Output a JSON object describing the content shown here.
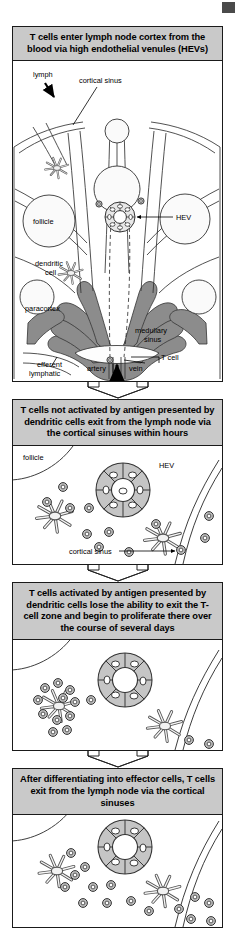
{
  "figure": {
    "title_sequence": "T cell trafficking through the lymph node",
    "panels": [
      {
        "id": "panel-1",
        "title": "T cells enter lymph node cortex from the blood via high endothelial venules (HEVs)",
        "labels": {
          "lymph": "lymph",
          "cortical_sinus": "cortical sinus",
          "follicle": "follicle",
          "dendritic_cell": "dendritic\ncell",
          "dendritic_cell_line1": "dendritic",
          "dendritic_cell_line2": "cell",
          "hev": "HEV",
          "paracortex": "paracortex",
          "medullary_sinus_line1": "medullary",
          "medullary_sinus_line2": "sinus",
          "efferent_lymphatic_line1": "efferent",
          "efferent_lymphatic_line2": "lymphatic",
          "artery": "artery",
          "vein": "vein",
          "t_cell": "T cell"
        }
      },
      {
        "id": "panel-2",
        "title": "T cells not activated by antigen presented by dendritic cells exit from the lymph node via the cortical sinuses within hours",
        "labels": {
          "follicle": "follicle",
          "hev": "HEV",
          "cortical_sinus": "cortical sinus"
        }
      },
      {
        "id": "panel-3",
        "title": "T cells activated by antigen presented by dendritic cells lose the ability to exit the T-cell zone and begin to proliferate there over the course of several days",
        "labels": {}
      },
      {
        "id": "panel-4",
        "title": "After differentiating into effector cells, T cells exit from the lymph node via the cortical sinuses",
        "labels": {}
      }
    ],
    "colors": {
      "title_background": "#c9c9c9",
      "outline": "#1a1a1a",
      "medulla_fill": "#8c8c8c",
      "hev_fill": "#c0c0c0",
      "cell_fill": "#bdbdbd",
      "page_background": "#ffffff"
    }
  }
}
